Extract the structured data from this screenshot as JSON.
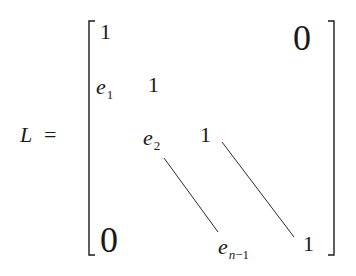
{
  "equation": {
    "lhs": "L",
    "equals": "=",
    "matrix": {
      "type": "lower-bidiagonal",
      "top_right_zero": "0",
      "bottom_left_zero": "0",
      "entries": [
        {
          "row": 1,
          "text": "1"
        },
        {
          "row": 2,
          "sub_base": "e",
          "sub_index": "1",
          "diag": "1"
        },
        {
          "row": 3,
          "sub_base": "e",
          "sub_index": "2",
          "diag": "1"
        },
        {
          "row": "n",
          "sub_base": "e",
          "sub_index": "n",
          "sub_index_rest": "−1",
          "diag": "1"
        }
      ]
    }
  }
}
